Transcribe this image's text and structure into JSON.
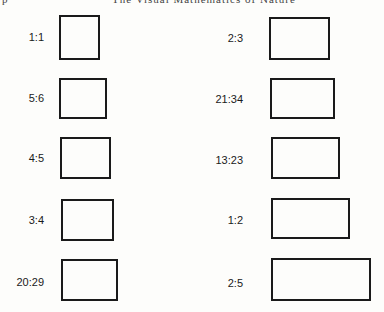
{
  "header": {
    "left_fragment": "p",
    "right_fragment": "The Visual Mathematics of Nature"
  },
  "left_column": [
    {
      "label": "1:1"
    },
    {
      "label": "5:6"
    },
    {
      "label": "4:5"
    },
    {
      "label": "3:4"
    },
    {
      "label": "20:29"
    }
  ],
  "right_column": [
    {
      "label": "2:3"
    },
    {
      "label": "21:34"
    },
    {
      "label": "13:23"
    },
    {
      "label": "1:2"
    },
    {
      "label": "2:5"
    }
  ]
}
